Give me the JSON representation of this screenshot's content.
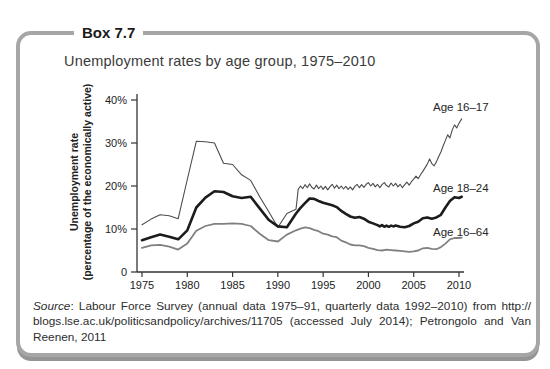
{
  "box": {
    "label": "Box 7.7",
    "title": "Unemployment rates by age group, 1975–2010"
  },
  "source": {
    "prefix_italic": "Source",
    "line1_rest": ": Labour Force Survey (annual data 1975–91, quarterly data 1992–2010) from http://",
    "line2": "blogs.lse.ac.uk/politicsandpolicy/archives/11705 (accessed July 2014); Petrongolo and Van",
    "line3": "Reenen, 2011"
  },
  "colors": {
    "box_border": "#a6a6a6",
    "box_shadow": "#959595",
    "axis": "#333333",
    "text": "#2d2d2d"
  },
  "chart_data": {
    "type": "line",
    "title": "Unemployment rates by age group, 1975–2010",
    "ylabel_line1": "Unemployment rate",
    "ylabel_line2": "(percentage of the economically active)",
    "xlabel": "",
    "xlim": [
      1975,
      2010
    ],
    "ylim": [
      0,
      40
    ],
    "grid": false,
    "legend_position": "end-of-line labels, right side",
    "note": "annual data 1975–91, quarterly data 1992–2010",
    "x_ticks": [
      1975,
      1980,
      1985,
      1990,
      1995,
      2000,
      2005,
      2010
    ],
    "y_ticks": [
      {
        "v": 0,
        "label": "0"
      },
      {
        "v": 10,
        "label": "10%"
      },
      {
        "v": 20,
        "label": "20%"
      },
      {
        "v": 30,
        "label": "30%"
      },
      {
        "v": 40,
        "label": "40%"
      }
    ],
    "series": [
      {
        "name": "Age 16–17",
        "color": "#4d4d4d",
        "width": 1.1,
        "points": [
          [
            1975,
            11.0
          ],
          [
            1976,
            12.3
          ],
          [
            1977,
            13.3
          ],
          [
            1978,
            13.1
          ],
          [
            1979,
            12.4
          ],
          [
            1980,
            21.5
          ],
          [
            1981,
            30.4
          ],
          [
            1982,
            30.3
          ],
          [
            1983,
            30.0
          ],
          [
            1984,
            25.3
          ],
          [
            1985,
            25.0
          ],
          [
            1986,
            22.6
          ],
          [
            1987,
            21.3
          ],
          [
            1988,
            17.5
          ],
          [
            1989,
            14.0
          ],
          [
            1990,
            10.4
          ],
          [
            1991,
            13.6
          ],
          [
            1992,
            14.6
          ],
          [
            1992.25,
            19.2
          ],
          [
            1992.5,
            20.0
          ],
          [
            1992.75,
            19.4
          ],
          [
            1993,
            20.3
          ],
          [
            1993.25,
            19.6
          ],
          [
            1993.5,
            20.5
          ],
          [
            1993.75,
            19.7
          ],
          [
            1994,
            19.3
          ],
          [
            1994.25,
            20.2
          ],
          [
            1994.5,
            19.4
          ],
          [
            1994.75,
            20.0
          ],
          [
            1995,
            19.2
          ],
          [
            1995.25,
            19.9
          ],
          [
            1995.5,
            19.1
          ],
          [
            1995.75,
            19.8
          ],
          [
            1996,
            20.4
          ],
          [
            1996.25,
            19.5
          ],
          [
            1996.5,
            20.2
          ],
          [
            1996.75,
            19.4
          ],
          [
            1997,
            20.0
          ],
          [
            1997.25,
            19.3
          ],
          [
            1997.5,
            19.9
          ],
          [
            1997.75,
            19.2
          ],
          [
            1998,
            19.8
          ],
          [
            1998.25,
            19.1
          ],
          [
            1998.5,
            19.9
          ],
          [
            1998.75,
            20.4
          ],
          [
            1999,
            19.6
          ],
          [
            1999.25,
            20.3
          ],
          [
            1999.5,
            19.7
          ],
          [
            1999.75,
            20.4
          ],
          [
            2000,
            20.8
          ],
          [
            2000.25,
            20.0
          ],
          [
            2000.5,
            20.6
          ],
          [
            2000.75,
            19.8
          ],
          [
            2001,
            20.4
          ],
          [
            2001.25,
            19.6
          ],
          [
            2001.5,
            20.3
          ],
          [
            2001.75,
            20.8
          ],
          [
            2002,
            20.1
          ],
          [
            2002.25,
            19.8
          ],
          [
            2002.5,
            20.7
          ],
          [
            2002.75,
            20.0
          ],
          [
            2003,
            20.6
          ],
          [
            2003.25,
            19.8
          ],
          [
            2003.5,
            20.4
          ],
          [
            2003.75,
            19.6
          ],
          [
            2004,
            20.3
          ],
          [
            2004.25,
            20.9
          ],
          [
            2004.5,
            20.2
          ],
          [
            2004.75,
            21.0
          ],
          [
            2005,
            21.6
          ],
          [
            2005.25,
            22.3
          ],
          [
            2005.5,
            21.7
          ],
          [
            2005.75,
            22.6
          ],
          [
            2006,
            23.4
          ],
          [
            2006.25,
            24.2
          ],
          [
            2006.5,
            25.1
          ],
          [
            2006.75,
            26.3
          ],
          [
            2007,
            25.2
          ],
          [
            2007.25,
            24.7
          ],
          [
            2007.5,
            25.6
          ],
          [
            2007.75,
            26.8
          ],
          [
            2008,
            27.9
          ],
          [
            2008.25,
            29.3
          ],
          [
            2008.5,
            30.6
          ],
          [
            2008.75,
            31.9
          ],
          [
            2009,
            31.2
          ],
          [
            2009.25,
            33.0
          ],
          [
            2009.5,
            34.2
          ],
          [
            2009.75,
            33.5
          ],
          [
            2010,
            34.6
          ],
          [
            2010.3,
            35.6
          ]
        ]
      },
      {
        "name": "Age 18–24",
        "color": "#1c1c1c",
        "width": 2.6,
        "points": [
          [
            1975,
            7.4
          ],
          [
            1976,
            8.1
          ],
          [
            1977,
            8.7
          ],
          [
            1978,
            8.2
          ],
          [
            1979,
            7.6
          ],
          [
            1980,
            9.7
          ],
          [
            1981,
            15.0
          ],
          [
            1982,
            17.3
          ],
          [
            1983,
            18.8
          ],
          [
            1984,
            18.6
          ],
          [
            1985,
            17.6
          ],
          [
            1986,
            17.2
          ],
          [
            1987,
            17.5
          ],
          [
            1988,
            14.8
          ],
          [
            1989,
            12.1
          ],
          [
            1990,
            10.6
          ],
          [
            1991,
            10.4
          ],
          [
            1992,
            13.6
          ],
          [
            1992.5,
            14.9
          ],
          [
            1993,
            16.0
          ],
          [
            1993.5,
            17.1
          ],
          [
            1994,
            17.0
          ],
          [
            1994.5,
            16.5
          ],
          [
            1995,
            16.1
          ],
          [
            1995.5,
            15.8
          ],
          [
            1996,
            15.5
          ],
          [
            1996.5,
            15.1
          ],
          [
            1997,
            14.2
          ],
          [
            1997.5,
            13.5
          ],
          [
            1998,
            12.9
          ],
          [
            1998.5,
            12.6
          ],
          [
            1999,
            12.8
          ],
          [
            1999.5,
            12.4
          ],
          [
            2000,
            11.7
          ],
          [
            2000.5,
            11.3
          ],
          [
            2001,
            10.9
          ],
          [
            2001.25,
            10.6
          ],
          [
            2001.5,
            10.9
          ],
          [
            2001.75,
            10.5
          ],
          [
            2002,
            10.8
          ],
          [
            2002.25,
            10.5
          ],
          [
            2002.5,
            10.8
          ],
          [
            2002.75,
            10.6
          ],
          [
            2003,
            10.8
          ],
          [
            2003.5,
            10.5
          ],
          [
            2004,
            10.4
          ],
          [
            2004.5,
            10.7
          ],
          [
            2005,
            11.3
          ],
          [
            2005.5,
            11.7
          ],
          [
            2006,
            12.5
          ],
          [
            2006.5,
            12.7
          ],
          [
            2007,
            12.4
          ],
          [
            2007.5,
            12.7
          ],
          [
            2008,
            13.3
          ],
          [
            2008.5,
            15.0
          ],
          [
            2009,
            16.5
          ],
          [
            2009.5,
            17.4
          ],
          [
            2010,
            17.2
          ],
          [
            2010.3,
            17.5
          ]
        ]
      },
      {
        "name": "Age 16–64",
        "color": "#808080",
        "width": 1.8,
        "points": [
          [
            1975,
            5.6
          ],
          [
            1976,
            6.2
          ],
          [
            1977,
            6.3
          ],
          [
            1978,
            5.9
          ],
          [
            1979,
            5.2
          ],
          [
            1980,
            6.6
          ],
          [
            1981,
            9.6
          ],
          [
            1982,
            10.7
          ],
          [
            1983,
            11.2
          ],
          [
            1984,
            11.2
          ],
          [
            1985,
            11.3
          ],
          [
            1986,
            11.2
          ],
          [
            1987,
            10.7
          ],
          [
            1988,
            8.9
          ],
          [
            1989,
            7.4
          ],
          [
            1990,
            7.1
          ],
          [
            1991,
            8.7
          ],
          [
            1992,
            9.7
          ],
          [
            1992.5,
            10.1
          ],
          [
            1993,
            10.4
          ],
          [
            1993.5,
            10.2
          ],
          [
            1994,
            9.8
          ],
          [
            1994.5,
            9.5
          ],
          [
            1995,
            8.9
          ],
          [
            1995.5,
            8.7
          ],
          [
            1996,
            8.3
          ],
          [
            1996.5,
            8.1
          ],
          [
            1997,
            7.3
          ],
          [
            1997.5,
            6.9
          ],
          [
            1998,
            6.4
          ],
          [
            1998.5,
            6.2
          ],
          [
            1999,
            6.2
          ],
          [
            1999.5,
            6.0
          ],
          [
            2000,
            5.6
          ],
          [
            2000.5,
            5.4
          ],
          [
            2001,
            5.1
          ],
          [
            2001.5,
            5.0
          ],
          [
            2002,
            5.2
          ],
          [
            2002.5,
            5.1
          ],
          [
            2003,
            5.0
          ],
          [
            2003.5,
            4.9
          ],
          [
            2004,
            4.8
          ],
          [
            2004.5,
            4.7
          ],
          [
            2005,
            4.8
          ],
          [
            2005.5,
            5.0
          ],
          [
            2006,
            5.5
          ],
          [
            2006.5,
            5.6
          ],
          [
            2007,
            5.4
          ],
          [
            2007.5,
            5.3
          ],
          [
            2008,
            5.8
          ],
          [
            2008.5,
            6.6
          ],
          [
            2009,
            7.6
          ],
          [
            2009.5,
            7.9
          ],
          [
            2010,
            7.9
          ],
          [
            2010.3,
            8.0
          ]
        ]
      }
    ]
  }
}
